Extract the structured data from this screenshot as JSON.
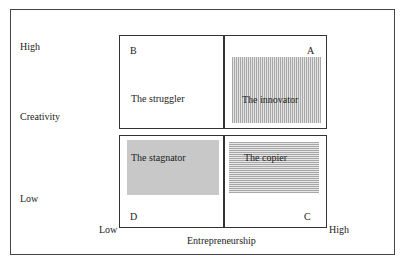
{
  "axes": {
    "y_label": "Creativity",
    "y_high": "High",
    "y_low": "Low",
    "x_label": "Entrepreneurship",
    "x_low": "Low",
    "x_high": "High"
  },
  "quadrants": [
    {
      "letter": "B",
      "label": "The struggler",
      "fill": "none"
    },
    {
      "letter": "A",
      "label": "The innovator",
      "fill": "vertical-stripes"
    },
    {
      "letter": "D",
      "label": "The stagnator",
      "fill": "solid-gray"
    },
    {
      "letter": "C",
      "label": "The copier",
      "fill": "horizontal-stripes"
    }
  ]
}
